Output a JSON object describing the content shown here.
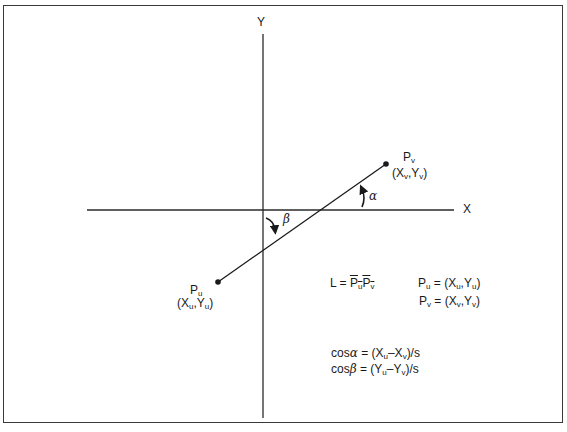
{
  "diagram": {
    "title": "",
    "axes": {
      "x_label": "X",
      "y_label": "Y"
    },
    "points": {
      "pu": {
        "name": "P",
        "sub": "u",
        "coords_open": "(X",
        "coords_sub1": "u",
        "coords_mid": ",Y",
        "coords_sub2": "u",
        "coords_close": ")"
      },
      "pv": {
        "name": "P",
        "sub": "v",
        "coords_open": "(X",
        "coords_sub1": "v",
        "coords_mid": ",Y",
        "coords_sub2": "v",
        "coords_close": ")"
      }
    },
    "angles": {
      "alpha": "α",
      "beta": "β"
    },
    "equations": {
      "length": {
        "lhs": "L = ",
        "p1": "P",
        "s1": "u",
        "p2": "P",
        "s2": "v"
      },
      "pu_def": {
        "p": "P",
        "s": "u",
        "eq": " = (X",
        "s1": "u",
        "mid": ",Y",
        "s2": "u",
        "close": ")"
      },
      "pv_def": {
        "p": "P",
        "s": "v",
        "eq": " = (X",
        "s1": "v",
        "mid": ",Y",
        "s2": "v",
        "close": ")"
      },
      "cos_alpha": {
        "cos": "cos",
        "greek": "α",
        "eq": " = (X",
        "s1": "u",
        "minus": "–X",
        "s2": "v",
        "tail": ")/s"
      },
      "cos_beta": {
        "cos": "cos",
        "greek": "β",
        "eq": " = (Y",
        "s1": "u",
        "minus": "–Y",
        "s2": "v",
        "tail": ")/s"
      }
    }
  }
}
